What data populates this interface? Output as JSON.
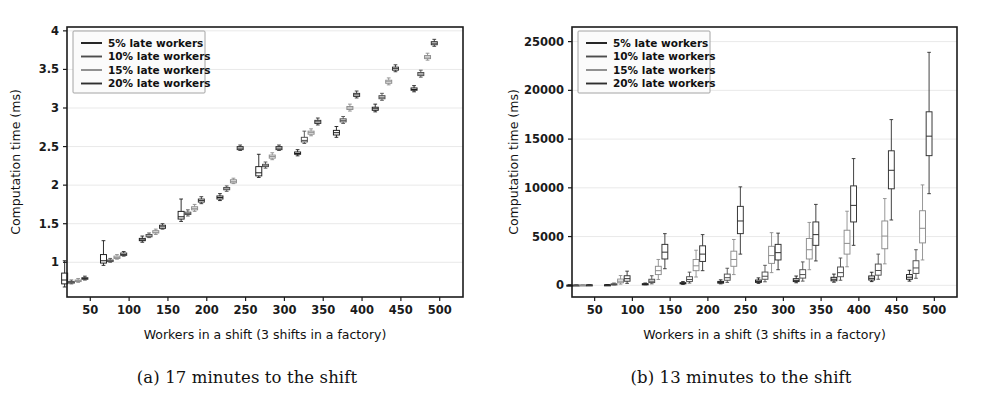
{
  "figure": {
    "panels": [
      {
        "id": "a",
        "caption": "(a) 17 minutes to the shift",
        "xlabel": "Workers in a shift (3 shifts in a factory)",
        "ylabel": "Computation time (ms)"
      },
      {
        "id": "b",
        "caption": "(b) 13 minutes to the shift",
        "xlabel": "Workers in a shift (3 shifts in a factory)",
        "ylabel": "Computation time (ms)"
      }
    ]
  },
  "legend": {
    "position": "upper-left",
    "entries": [
      {
        "label": "5% late workers",
        "color": "#1b1b1b"
      },
      {
        "label": "10% late workers",
        "color": "#4d4d4d"
      },
      {
        "label": "15% late workers",
        "color": "#8c8c8c"
      },
      {
        "label": "20% late workers",
        "color": "#2f2f2f"
      }
    ]
  },
  "chart_data": [
    {
      "type": "box",
      "panel": "a",
      "title": "(a) 17 minutes to the shift",
      "xlabel": "Workers in a shift (3 shifts in a factory)",
      "ylabel": "Computation time (ms)",
      "xlim": [
        20,
        530
      ],
      "ylim": [
        0.55,
        4.05
      ],
      "xticks": [
        50,
        100,
        150,
        200,
        250,
        300,
        350,
        400,
        450,
        500
      ],
      "yticks": [
        1.0,
        1.5,
        2.0,
        2.5,
        3.0,
        3.5,
        4.0
      ],
      "grid": true,
      "x": [
        30,
        80,
        130,
        180,
        230,
        280,
        330,
        380,
        430,
        480
      ],
      "series": [
        {
          "name": "5% late workers",
          "color": "#1b1b1b",
          "boxes": [
            {
              "x": 30,
              "whislo": 0.68,
              "q1": 0.72,
              "med": 0.77,
              "q3": 0.86,
              "whishi": 1.02
            },
            {
              "x": 80,
              "whislo": 0.96,
              "q1": 0.99,
              "med": 1.02,
              "q3": 1.1,
              "whishi": 1.28
            },
            {
              "x": 130,
              "whislo": 1.26,
              "q1": 1.28,
              "med": 1.29,
              "q3": 1.31,
              "whishi": 1.34
            },
            {
              "x": 180,
              "whislo": 1.53,
              "q1": 1.56,
              "med": 1.59,
              "q3": 1.66,
              "whishi": 1.82
            },
            {
              "x": 230,
              "whislo": 1.8,
              "q1": 1.82,
              "med": 1.84,
              "q3": 1.86,
              "whishi": 1.89
            },
            {
              "x": 280,
              "whislo": 2.1,
              "q1": 2.12,
              "med": 2.16,
              "q3": 2.24,
              "whishi": 2.4
            },
            {
              "x": 330,
              "whislo": 2.38,
              "q1": 2.4,
              "med": 2.41,
              "q3": 2.43,
              "whishi": 2.46
            },
            {
              "x": 380,
              "whislo": 2.62,
              "q1": 2.65,
              "med": 2.68,
              "q3": 2.71,
              "whishi": 2.76
            },
            {
              "x": 430,
              "whislo": 2.95,
              "q1": 2.97,
              "med": 2.99,
              "q3": 3.01,
              "whishi": 3.05
            },
            {
              "x": 480,
              "whislo": 3.21,
              "q1": 3.23,
              "med": 3.24,
              "q3": 3.26,
              "whishi": 3.29
            }
          ]
        },
        {
          "name": "10% late workers",
          "color": "#4d4d4d",
          "boxes": [
            {
              "x": 30,
              "whislo": 0.72,
              "q1": 0.73,
              "med": 0.74,
              "q3": 0.75,
              "whishi": 0.77
            },
            {
              "x": 80,
              "whislo": 1.0,
              "q1": 1.01,
              "med": 1.02,
              "q3": 1.03,
              "whishi": 1.05
            },
            {
              "x": 130,
              "whislo": 1.32,
              "q1": 1.33,
              "med": 1.34,
              "q3": 1.36,
              "whishi": 1.38
            },
            {
              "x": 180,
              "whislo": 1.6,
              "q1": 1.62,
              "med": 1.63,
              "q3": 1.65,
              "whishi": 1.68
            },
            {
              "x": 230,
              "whislo": 1.92,
              "q1": 1.94,
              "med": 1.95,
              "q3": 1.97,
              "whishi": 1.99
            },
            {
              "x": 280,
              "whislo": 2.22,
              "q1": 2.24,
              "med": 2.25,
              "q3": 2.27,
              "whishi": 2.3
            },
            {
              "x": 330,
              "whislo": 2.54,
              "q1": 2.56,
              "med": 2.58,
              "q3": 2.62,
              "whishi": 2.7
            },
            {
              "x": 380,
              "whislo": 2.8,
              "q1": 2.82,
              "med": 2.84,
              "q3": 2.86,
              "whishi": 2.89
            },
            {
              "x": 430,
              "whislo": 3.1,
              "q1": 3.12,
              "med": 3.14,
              "q3": 3.16,
              "whishi": 3.19
            },
            {
              "x": 480,
              "whislo": 3.4,
              "q1": 3.42,
              "med": 3.44,
              "q3": 3.46,
              "whishi": 3.49
            }
          ]
        },
        {
          "name": "15% late workers",
          "color": "#8c8c8c",
          "boxes": [
            {
              "x": 30,
              "whislo": 0.74,
              "q1": 0.75,
              "med": 0.76,
              "q3": 0.77,
              "whishi": 0.79
            },
            {
              "x": 80,
              "whislo": 1.04,
              "q1": 1.05,
              "med": 1.06,
              "q3": 1.08,
              "whishi": 1.1
            },
            {
              "x": 130,
              "whislo": 1.36,
              "q1": 1.38,
              "med": 1.39,
              "q3": 1.41,
              "whishi": 1.43
            },
            {
              "x": 180,
              "whislo": 1.66,
              "q1": 1.68,
              "med": 1.7,
              "q3": 1.72,
              "whishi": 1.75
            },
            {
              "x": 230,
              "whislo": 2.02,
              "q1": 2.03,
              "med": 2.05,
              "q3": 2.07,
              "whishi": 2.09
            },
            {
              "x": 280,
              "whislo": 2.33,
              "q1": 2.35,
              "med": 2.37,
              "q3": 2.39,
              "whishi": 2.42
            },
            {
              "x": 330,
              "whislo": 2.64,
              "q1": 2.66,
              "med": 2.68,
              "q3": 2.7,
              "whishi": 2.73
            },
            {
              "x": 380,
              "whislo": 2.96,
              "q1": 2.98,
              "med": 3.0,
              "q3": 3.02,
              "whishi": 3.05
            },
            {
              "x": 430,
              "whislo": 3.3,
              "q1": 3.32,
              "med": 3.34,
              "q3": 3.36,
              "whishi": 3.39
            },
            {
              "x": 480,
              "whislo": 3.62,
              "q1": 3.64,
              "med": 3.66,
              "q3": 3.68,
              "whishi": 3.71
            }
          ]
        },
        {
          "name": "20% late workers",
          "color": "#2f2f2f",
          "boxes": [
            {
              "x": 30,
              "whislo": 0.77,
              "q1": 0.78,
              "med": 0.79,
              "q3": 0.8,
              "whishi": 0.82
            },
            {
              "x": 80,
              "whislo": 1.08,
              "q1": 1.09,
              "med": 1.1,
              "q3": 1.12,
              "whishi": 1.14
            },
            {
              "x": 130,
              "whislo": 1.43,
              "q1": 1.44,
              "med": 1.46,
              "q3": 1.48,
              "whishi": 1.5
            },
            {
              "x": 180,
              "whislo": 1.76,
              "q1": 1.78,
              "med": 1.8,
              "q3": 1.82,
              "whishi": 1.85
            },
            {
              "x": 230,
              "whislo": 2.45,
              "q1": 2.46,
              "med": 2.48,
              "q3": 2.5,
              "whishi": 2.52
            },
            {
              "x": 280,
              "whislo": 2.45,
              "q1": 2.46,
              "med": 2.48,
              "q3": 2.5,
              "whishi": 2.52
            },
            {
              "x": 330,
              "whislo": 2.78,
              "q1": 2.8,
              "med": 2.82,
              "q3": 2.84,
              "whishi": 2.87
            },
            {
              "x": 380,
              "whislo": 3.13,
              "q1": 3.15,
              "med": 3.17,
              "q3": 3.19,
              "whishi": 3.22
            },
            {
              "x": 430,
              "whislo": 3.47,
              "q1": 3.49,
              "med": 3.51,
              "q3": 3.53,
              "whishi": 3.56
            },
            {
              "x": 480,
              "whislo": 3.8,
              "q1": 3.82,
              "med": 3.84,
              "q3": 3.86,
              "whishi": 3.89
            }
          ]
        }
      ]
    },
    {
      "type": "box",
      "panel": "b",
      "title": "(b) 13 minutes to the shift",
      "xlabel": "Workers in a shift (3 shifts in a factory)",
      "ylabel": "Computation time (ms)",
      "xlim": [
        20,
        530
      ],
      "ylim": [
        -1200,
        26500
      ],
      "xticks": [
        50,
        100,
        150,
        200,
        250,
        300,
        350,
        400,
        450,
        500
      ],
      "yticks": [
        0,
        5000,
        10000,
        15000,
        20000,
        25000
      ],
      "grid": true,
      "x": [
        30,
        80,
        130,
        180,
        230,
        280,
        330,
        380,
        430,
        480
      ],
      "series": [
        {
          "name": "5% late workers",
          "color": "#1b1b1b",
          "boxes": [
            {
              "x": 30,
              "whislo": 5,
              "q1": 8,
              "med": 12,
              "q3": 16,
              "whishi": 22
            },
            {
              "x": 80,
              "whislo": 20,
              "q1": 30,
              "med": 40,
              "q3": 55,
              "whishi": 80
            },
            {
              "x": 130,
              "whislo": 60,
              "q1": 90,
              "med": 120,
              "q3": 160,
              "whishi": 230
            },
            {
              "x": 180,
              "whislo": 100,
              "q1": 150,
              "med": 200,
              "q3": 270,
              "whishi": 380
            },
            {
              "x": 230,
              "whislo": 150,
              "q1": 220,
              "med": 300,
              "q3": 400,
              "whishi": 560
            },
            {
              "x": 280,
              "whislo": 200,
              "q1": 300,
              "med": 400,
              "q3": 540,
              "whishi": 760
            },
            {
              "x": 330,
              "whislo": 260,
              "q1": 380,
              "med": 510,
              "q3": 680,
              "whishi": 950
            },
            {
              "x": 380,
              "whislo": 320,
              "q1": 460,
              "med": 620,
              "q3": 820,
              "whishi": 1150
            },
            {
              "x": 430,
              "whislo": 380,
              "q1": 540,
              "med": 720,
              "q3": 960,
              "whishi": 1340
            },
            {
              "x": 480,
              "whislo": 430,
              "q1": 620,
              "med": 830,
              "q3": 1100,
              "whishi": 1540
            }
          ]
        },
        {
          "name": "10% late workers",
          "color": "#4d4d4d",
          "boxes": [
            {
              "x": 30,
              "whislo": 8,
              "q1": 14,
              "med": 20,
              "q3": 28,
              "whishi": 40
            },
            {
              "x": 80,
              "whislo": 40,
              "q1": 70,
              "med": 100,
              "q3": 150,
              "whishi": 230
            },
            {
              "x": 130,
              "whislo": 150,
              "q1": 280,
              "med": 420,
              "q3": 620,
              "whishi": 980
            },
            {
              "x": 180,
              "whislo": 230,
              "q1": 400,
              "med": 600,
              "q3": 880,
              "whishi": 1350
            },
            {
              "x": 230,
              "whislo": 300,
              "q1": 520,
              "med": 780,
              "q3": 1150,
              "whishi": 1750
            },
            {
              "x": 280,
              "whislo": 360,
              "q1": 620,
              "med": 930,
              "q3": 1360,
              "whishi": 2050
            },
            {
              "x": 330,
              "whislo": 430,
              "q1": 740,
              "med": 1100,
              "q3": 1600,
              "whishi": 2400
            },
            {
              "x": 380,
              "whislo": 520,
              "q1": 880,
              "med": 1300,
              "q3": 1880,
              "whishi": 2800
            },
            {
              "x": 430,
              "whislo": 620,
              "q1": 1040,
              "med": 1520,
              "q3": 2180,
              "whishi": 3200
            },
            {
              "x": 480,
              "whislo": 720,
              "q1": 1220,
              "med": 1780,
              "q3": 2520,
              "whishi": 3650
            }
          ]
        },
        {
          "name": "15% late workers",
          "color": "#8c8c8c",
          "boxes": [
            {
              "x": 30,
              "whislo": 10,
              "q1": 18,
              "med": 26,
              "q3": 36,
              "whishi": 52
            },
            {
              "x": 80,
              "whislo": 120,
              "q1": 260,
              "med": 420,
              "q3": 640,
              "whishi": 1000
            },
            {
              "x": 130,
              "whislo": 600,
              "q1": 1100,
              "med": 1500,
              "q3": 1950,
              "whishi": 2650
            },
            {
              "x": 180,
              "whislo": 850,
              "q1": 1500,
              "med": 2000,
              "q3": 2650,
              "whishi": 3600
            },
            {
              "x": 230,
              "whislo": 1100,
              "q1": 1950,
              "med": 2650,
              "q3": 3500,
              "whishi": 4700
            },
            {
              "x": 280,
              "whislo": 1300,
              "q1": 2250,
              "med": 3050,
              "q3": 4000,
              "whishi": 5400
            },
            {
              "x": 330,
              "whislo": 1600,
              "q1": 2700,
              "med": 3650,
              "q3": 4800,
              "whishi": 6450
            },
            {
              "x": 380,
              "whislo": 1900,
              "q1": 3200,
              "med": 4300,
              "q3": 5650,
              "whishi": 7600
            },
            {
              "x": 430,
              "whislo": 2200,
              "q1": 3750,
              "med": 5050,
              "q3": 6600,
              "whishi": 8900
            },
            {
              "x": 480,
              "whislo": 2600,
              "q1": 4350,
              "med": 5850,
              "q3": 7650,
              "whishi": 10300
            }
          ]
        },
        {
          "name": "20% late workers",
          "color": "#2f2f2f",
          "boxes": [
            {
              "x": 30,
              "whislo": 12,
              "q1": 22,
              "med": 34,
              "q3": 48,
              "whishi": 70
            },
            {
              "x": 80,
              "whislo": 200,
              "q1": 420,
              "med": 680,
              "q3": 980,
              "whishi": 1450
            },
            {
              "x": 130,
              "whislo": 1700,
              "q1": 2700,
              "med": 3400,
              "q3": 4200,
              "whishi": 5300
            },
            {
              "x": 180,
              "whislo": 1500,
              "q1": 2450,
              "med": 3200,
              "q3": 4050,
              "whishi": 5200
            },
            {
              "x": 230,
              "whislo": 3200,
              "q1": 5300,
              "med": 6600,
              "q3": 8100,
              "whishi": 10100
            },
            {
              "x": 280,
              "whislo": 1600,
              "q1": 2600,
              "med": 3350,
              "q3": 4200,
              "whishi": 5350
            },
            {
              "x": 330,
              "whislo": 2500,
              "q1": 4100,
              "med": 5200,
              "q3": 6500,
              "whishi": 8300
            },
            {
              "x": 380,
              "whislo": 4100,
              "q1": 6500,
              "med": 8200,
              "q3": 10200,
              "whishi": 13000
            },
            {
              "x": 430,
              "whislo": 6700,
              "q1": 9900,
              "med": 11800,
              "q3": 13800,
              "whishi": 17000
            },
            {
              "x": 480,
              "whislo": 9400,
              "q1": 13300,
              "med": 15300,
              "q3": 17800,
              "whishi": 23900
            }
          ]
        }
      ]
    }
  ]
}
